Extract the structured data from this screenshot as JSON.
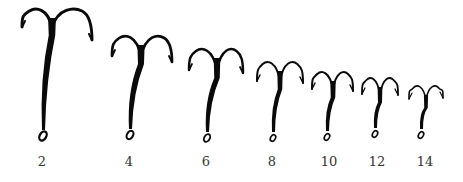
{
  "figure": {
    "background": "#ffffff",
    "ink_color": "#0a0a0a",
    "label_color": "#333333"
  },
  "hooks": [
    {
      "size_label": "2",
      "cx": 52,
      "top": 10,
      "left_tip": [
        22,
        27
      ],
      "right_tip": [
        92,
        40
      ],
      "eye": [
        43,
        140
      ],
      "shank_w": 6.5
    },
    {
      "size_label": "4",
      "cx": 141,
      "top": 37,
      "left_tip": [
        112,
        56
      ],
      "right_tip": [
        172,
        62
      ],
      "eye": [
        130,
        139
      ],
      "shank_w": 6
    },
    {
      "size_label": "6",
      "cx": 217,
      "top": 50,
      "left_tip": [
        189,
        70
      ],
      "right_tip": [
        243,
        73
      ],
      "eye": [
        207,
        142
      ],
      "shank_w": 5.5
    },
    {
      "size_label": "8",
      "cx": 280,
      "top": 63,
      "left_tip": [
        257,
        81
      ],
      "right_tip": [
        303,
        83
      ],
      "eye": [
        273,
        142
      ],
      "shank_w": 4.5
    },
    {
      "size_label": "10",
      "cx": 333,
      "top": 73,
      "left_tip": [
        312,
        89
      ],
      "right_tip": [
        353,
        91
      ],
      "eye": [
        327,
        141
      ],
      "shank_w": 4.5
    },
    {
      "size_label": "12",
      "cx": 380,
      "top": 79,
      "left_tip": [
        362,
        94
      ],
      "right_tip": [
        398,
        95
      ],
      "eye": [
        375,
        138
      ],
      "shank_w": 4
    },
    {
      "size_label": "14",
      "cx": 426,
      "top": 87,
      "left_tip": [
        409,
        99
      ],
      "right_tip": [
        443,
        98
      ],
      "eye": [
        421,
        139
      ],
      "shank_w": 3.5
    }
  ],
  "labels": [
    {
      "text": "2",
      "x": 42
    },
    {
      "text": "4",
      "x": 129
    },
    {
      "text": "6",
      "x": 206
    },
    {
      "text": "8",
      "x": 272
    },
    {
      "text": "10",
      "x": 329
    },
    {
      "text": "12",
      "x": 377
    },
    {
      "text": "14",
      "x": 425
    }
  ]
}
